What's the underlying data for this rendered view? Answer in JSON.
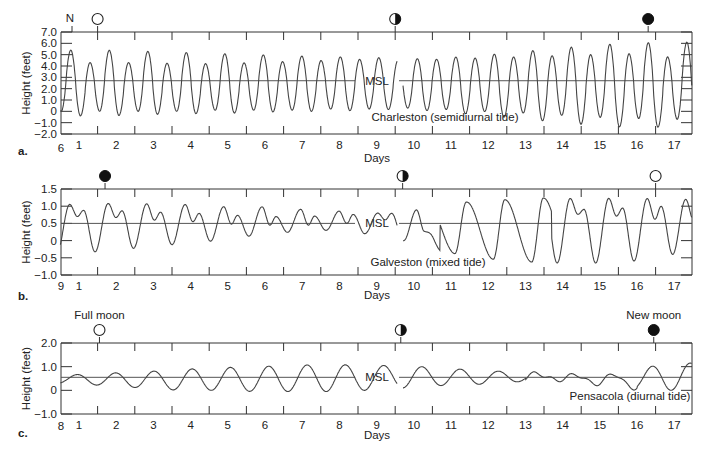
{
  "chart_data": [
    {
      "type": "line",
      "panel_label": "a.",
      "title": "Charleston (semidiurnal tide)",
      "xlabel": "Days",
      "ylabel": "Height (feet)",
      "msl_label": "MSL",
      "msl": 2.7,
      "ylim": [
        -2.0,
        7.0
      ],
      "yticks": [
        "7.0",
        "6.0",
        "5.0",
        "4.0",
        "3.0",
        "2.0",
        "1.0",
        "0",
        "-1.0",
        "-2.0"
      ],
      "ytick_values": [
        7,
        6,
        5,
        4,
        3,
        2,
        1,
        0,
        -1,
        -2
      ],
      "x_start_label": "6",
      "xticks": [
        "1",
        "2",
        "3",
        "4",
        "5",
        "6",
        "7",
        "8",
        "9",
        "10",
        "11",
        "12",
        "13",
        "14",
        "15",
        "16",
        "17"
      ],
      "moon_phases": [
        {
          "day": 1.5,
          "phase": "full",
          "label": ""
        },
        {
          "day": 9.5,
          "phase": "first-quarter",
          "label": ""
        },
        {
          "day": 16.3,
          "phase": "new",
          "label": ""
        }
      ],
      "extra_marker": "N",
      "series": [
        {
          "name": "Charleston tide",
          "pattern": "semidiurnal",
          "high_highs": [
            5.4,
            5.4,
            5.3,
            5.2,
            5.1,
            5.0,
            4.9,
            4.8,
            4.8,
            4.6,
            4.7,
            4.9,
            5.2,
            5.5,
            5.8,
            6.0,
            6.1
          ],
          "low_highs": [
            4.3,
            4.3,
            4.3,
            4.2,
            4.2,
            4.3,
            4.4,
            4.5,
            4.6,
            4.5,
            4.6,
            4.7,
            4.8,
            4.9,
            5.0,
            5.1,
            4.8
          ],
          "low_lows": [
            -0.4,
            -0.4,
            -0.3,
            -0.2,
            -0.2,
            -0.1,
            0.0,
            0.0,
            0.1,
            0.2,
            0.0,
            -0.3,
            -0.6,
            -0.9,
            -1.2,
            -1.4,
            -1.4
          ],
          "high_lows": [
            0.0,
            0.0,
            0.0,
            0.0,
            0.1,
            0.1,
            0.1,
            0.2,
            0.2,
            0.3,
            0.2,
            0.0,
            -0.1,
            -0.3,
            -0.5,
            -0.6,
            -0.7
          ]
        }
      ]
    },
    {
      "type": "line",
      "panel_label": "b.",
      "title": "Galveston (mixed tide)",
      "xlabel": "Days",
      "ylabel": "Height (feet)",
      "msl_label": "MSL",
      "msl": 0.5,
      "ylim": [
        -1.0,
        1.5
      ],
      "yticks": [
        "1.5",
        "1.0",
        "0.5",
        "0",
        "-0.5",
        "-1.0"
      ],
      "ytick_values": [
        1.5,
        1.0,
        0.5,
        0,
        -0.5,
        -1.0
      ],
      "x_start_label": "9",
      "xticks": [
        "1",
        "2",
        "3",
        "4",
        "5",
        "6",
        "7",
        "8",
        "9",
        "10",
        "11",
        "12",
        "13",
        "14",
        "15",
        "16",
        "17"
      ],
      "moon_phases": [
        {
          "day": 1.7,
          "phase": "new",
          "label": ""
        },
        {
          "day": 9.7,
          "phase": "first-quarter",
          "label": ""
        },
        {
          "day": 16.5,
          "phase": "full",
          "label": ""
        }
      ],
      "series": [
        {
          "name": "Galveston tide",
          "pattern": "mixed",
          "main_high": [
            1.05,
            1.08,
            1.07,
            1.06,
            0.98,
            1.0,
            0.92,
            0.88,
            0.8,
            0.8,
            1.05,
            1.15,
            1.2,
            1.25,
            1.2,
            1.25,
            1.2
          ],
          "secondary_high": [
            0.88,
            0.88,
            0.85,
            0.8,
            0.78,
            0.7,
            0.7,
            0.72,
            0.78,
            0.8,
            0.0,
            0.0,
            0.0,
            0.95,
            0.9,
            0.95,
            1.0
          ],
          "intermediate_low": [
            0.7,
            0.7,
            0.6,
            0.58,
            0.5,
            0.45,
            0.45,
            0.45,
            0.55,
            0.65,
            0.0,
            0.0,
            0.0,
            0.8,
            0.75,
            0.7,
            0.6
          ],
          "main_low": [
            -0.4,
            -0.3,
            -0.2,
            -0.1,
            0.0,
            0.15,
            0.25,
            0.3,
            0.2,
            0.0,
            -0.3,
            -0.5,
            -0.6,
            -0.65,
            -0.65,
            -0.65,
            -0.4
          ]
        }
      ]
    },
    {
      "type": "line",
      "panel_label": "c.",
      "title": "Pensacola (diurnal tide)",
      "xlabel": "Days",
      "ylabel": "Height (feet)",
      "msl_label": "MSL",
      "msl": 0.55,
      "ylim": [
        -1.0,
        2.0
      ],
      "yticks": [
        "2.0",
        "1.0",
        "0",
        "-1.0"
      ],
      "ytick_values": [
        2,
        1,
        0,
        -1
      ],
      "x_start_label": "8",
      "xticks": [
        "1",
        "2",
        "3",
        "4",
        "5",
        "6",
        "7",
        "8",
        "9",
        "10",
        "11",
        "12",
        "13",
        "14",
        "15",
        "16",
        "17"
      ],
      "moon_phases": [
        {
          "day": 1.55,
          "phase": "full",
          "label": "Full moon"
        },
        {
          "day": 9.65,
          "phase": "first-quarter",
          "label": ""
        },
        {
          "day": 16.45,
          "phase": "new",
          "label": "New moon"
        }
      ],
      "series": [
        {
          "name": "Pensacola tide",
          "pattern": "diurnal",
          "highs": [
            0.65,
            0.72,
            0.78,
            0.88,
            0.95,
            1.0,
            1.05,
            1.1,
            1.05,
            1.05,
            0.95,
            0.85,
            0.78,
            0.68,
            0.65,
            0.7,
            1.15
          ],
          "lows": [
            0.3,
            0.2,
            0.1,
            0.0,
            0.0,
            -0.05,
            -0.05,
            -0.05,
            0.0,
            0.1,
            0.2,
            0.25,
            0.35,
            0.45,
            0.3,
            0.1,
            0.0
          ]
        }
      ]
    }
  ],
  "panels": {
    "a": {
      "label": "a.",
      "title": "Charleston (semidiurnal tide)",
      "xlabel": "Days",
      "x_start": "6"
    },
    "b": {
      "label": "b.",
      "title": "Galveston (mixed tide)",
      "xlabel": "Days",
      "x_start": "9"
    },
    "c": {
      "label": "c.",
      "title": "Pensacola (diurnal tide)",
      "xlabel": "Days",
      "x_start": "8",
      "full_moon_label": "Full moon",
      "new_moon_label": "New moon"
    }
  }
}
